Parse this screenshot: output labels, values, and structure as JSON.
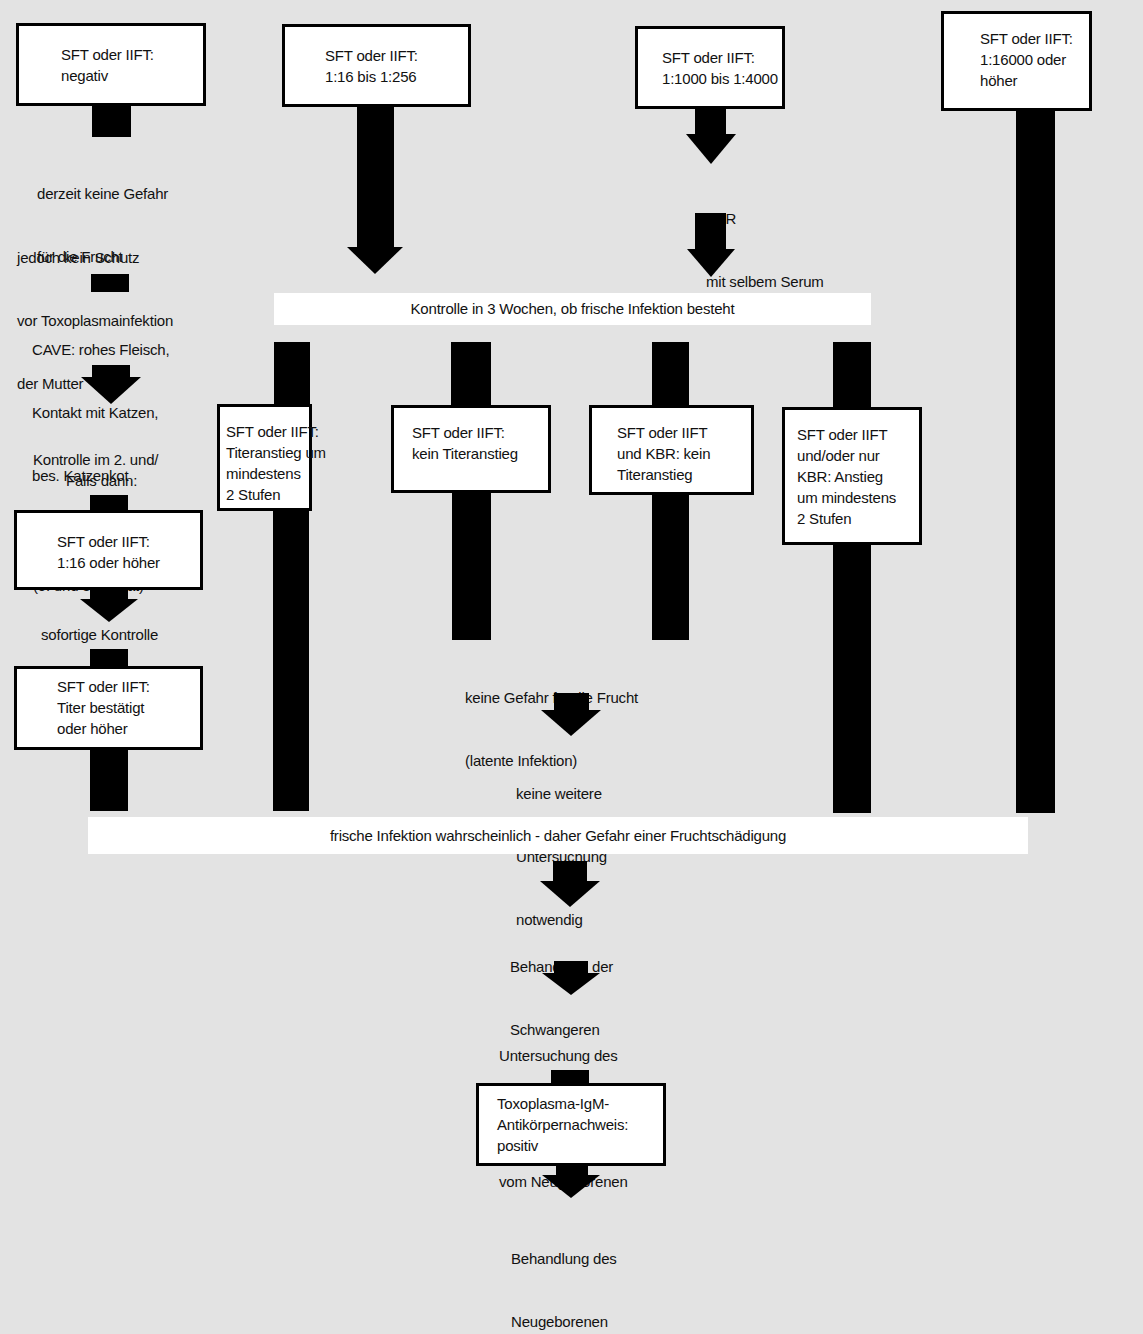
{
  "diagram": {
    "title": "",
    "colors": {
      "background": "#e3e3e3",
      "box": "#ffffff",
      "arrow": "#000000"
    },
    "top_boxes": [
      {
        "id": "neg",
        "lines": [
          "SFT oder IIFT:",
          "negativ"
        ]
      },
      {
        "id": "low",
        "lines": [
          "SFT oder IIFT:",
          "1:16 bis 1:256"
        ]
      },
      {
        "id": "mid",
        "lines": [
          "SFT oder IIFT:",
          "1:1000 bis 1:4000"
        ]
      },
      {
        "id": "high",
        "lines": [
          "SFT oder IIFT:",
          "1:16000 oder",
          "höher"
        ]
      }
    ],
    "left_branch": {
      "note1": [
        "derzeit keine Gefahr",
        "für die Frucht"
      ],
      "note2": [
        "jedoch kein Schutz",
        "vor Toxoplasmainfektion",
        "der Mutter"
      ],
      "note3": [
        "CAVE: rohes Fleisch,",
        "Kontakt mit Katzen,",
        "bes. Katzenkot"
      ],
      "note4": [
        "Kontrolle im 2. und/",
        "oder 3. Trimenon",
        "(5. und 8. Monat)"
      ],
      "note5": "Falls dann:",
      "box1": [
        "SFT oder IIFT:",
        "1:16 oder höher"
      ],
      "note6": "sofortige Kontrolle",
      "box2": [
        "SFT oder IIFT:",
        "Titer bestätigt",
        "oder höher"
      ]
    },
    "mid_branch": {
      "kbr_note": [
        "KBR",
        "mit selbem Serum"
      ]
    },
    "banner_control": "Kontrolle in 3 Wochen, ob frische Infektion besteht",
    "result_boxes": [
      {
        "id": "rise",
        "lines": [
          "SFT oder IIFT:",
          "Titeranstieg um",
          "mindestens",
          "2 Stufen"
        ]
      },
      {
        "id": "norise",
        "lines": [
          "SFT oder IIFT:",
          "kein Titeranstieg"
        ]
      },
      {
        "id": "kbr_norise",
        "lines": [
          "SFT oder IIFT",
          "und KBR: kein",
          "Titeranstieg"
        ]
      },
      {
        "id": "kbr_rise",
        "lines": [
          "SFT oder IIFT",
          "und/oder nur",
          "KBR: Anstieg",
          "um mindestens",
          "2 Stufen"
        ]
      }
    ],
    "latent": {
      "text": [
        "keine Gefahr für die Frucht",
        "(latente Infektion)"
      ],
      "next": [
        "keine weitere",
        "Untersuchung",
        "notwendig"
      ]
    },
    "banner_infection": "frische Infektion wahrscheinlich - daher Gefahr einer Fruchtschädigung",
    "bottom": {
      "step1": [
        "Behandlung der",
        "Schwangeren"
      ],
      "step2": [
        "Untersuchung des",
        "Nabelschnurblutes",
        "vom Neugeborenen"
      ],
      "box": [
        "Toxoplasma-IgM-",
        "Antikörpernachweis:",
        "positiv"
      ],
      "step3": [
        "Behandlung des",
        "Neugeborenen"
      ]
    }
  }
}
